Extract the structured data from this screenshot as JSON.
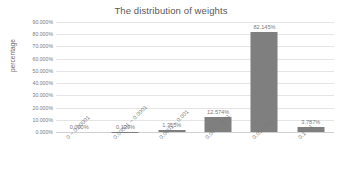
{
  "chart_data": {
    "type": "bar",
    "title": "The distribution of weights",
    "xlabel": "",
    "ylabel": "percentage",
    "categories": [
      "0 ~ 0.00001",
      "0.00001 ~ 0.0001",
      "0.0001 ~ 0.001",
      "0.001 ~ 0.01",
      "0.01 ~ 0.1",
      "0.1 ~ 1"
    ],
    "values": [
      0.0,
      0.139,
      1.355,
      12.574,
      82.145,
      3.787
    ],
    "value_labels": [
      "0.000%",
      "0.139%",
      "1.355%",
      "12.574%",
      "82.145%",
      "3.787%"
    ],
    "ylim": [
      0,
      90
    ],
    "ytick_values": [
      0,
      10,
      20,
      30,
      40,
      50,
      60,
      70,
      80,
      90
    ],
    "ytick_labels": [
      "0.000%",
      "10.000%",
      "20.000%",
      "30.000%",
      "40.000%",
      "50.000%",
      "60.000%",
      "70.000%",
      "80.000%",
      "90.000%"
    ],
    "grid": true,
    "legend": false,
    "bar_color": "#7f7f7f",
    "gridline_color": "#e4e4e4",
    "text_color": "#7a7a7a",
    "title_color": "#595959",
    "background": "#ffffff"
  }
}
